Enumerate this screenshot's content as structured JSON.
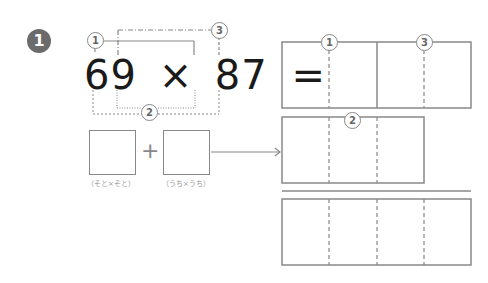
{
  "problem": {
    "number": "1",
    "equation": {
      "left": "69",
      "operator": "×",
      "right": "87",
      "equals": "="
    },
    "markers": {
      "m1": "1",
      "m2": "2",
      "m3": "3"
    },
    "sum_boxes": {
      "plus": "+",
      "outer_label": "（そと×そと）",
      "inner_label": "（うち×うち）"
    },
    "grids": {
      "top_markers": [
        "1",
        "3"
      ],
      "middle_marker": "2"
    }
  },
  "colors": {
    "line": "#888888",
    "text": "#1a1a1a",
    "badge": "#6b6b6b"
  }
}
